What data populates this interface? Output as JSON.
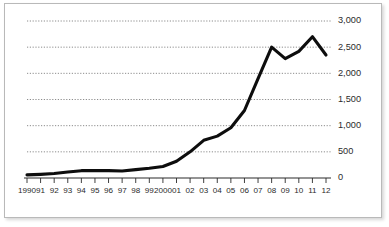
{
  "chart_data": {
    "type": "line",
    "title": "",
    "subtitle": "",
    "xlabel": "",
    "ylabel": "",
    "grid": true,
    "legend": "none",
    "xlim": [
      1990,
      2012
    ],
    "ylim": [
      0,
      3000
    ],
    "y_ticks": [
      0,
      500,
      1000,
      1500,
      2000,
      2500,
      3000
    ],
    "y_tick_labels": [
      "0",
      "500",
      "1,000",
      "1,500",
      "2,000",
      "2,500",
      "3,000"
    ],
    "categories": [
      "1990",
      "91",
      "92",
      "93",
      "94",
      "95",
      "96",
      "97",
      "98",
      "99",
      "2000",
      "01",
      "02",
      "03",
      "04",
      "05",
      "06",
      "07",
      "08",
      "09",
      "10",
      "11",
      "12"
    ],
    "x": [
      1990,
      1991,
      1992,
      1993,
      1994,
      1995,
      1996,
      1997,
      1998,
      1999,
      2000,
      2001,
      2002,
      2003,
      2004,
      2005,
      2006,
      2007,
      2008,
      2009,
      2010,
      2011,
      2012
    ],
    "values": [
      60,
      70,
      85,
      115,
      140,
      140,
      140,
      135,
      160,
      185,
      220,
      320,
      500,
      720,
      800,
      960,
      1290,
      1900,
      2500,
      2280,
      2420,
      2700,
      2350
    ],
    "series": [
      {
        "name": "series-1",
        "values": [
          60,
          70,
          85,
          115,
          140,
          140,
          140,
          135,
          160,
          185,
          220,
          320,
          500,
          720,
          800,
          960,
          1290,
          1900,
          2500,
          2280,
          2420,
          2700,
          2350
        ]
      }
    ],
    "colors": {
      "line": "#0d0d0d",
      "grid": "#6e6e6e",
      "axis": "#2a2a2a",
      "frame": "#b9b9b9",
      "background": "#ffffff",
      "text": "#2b2b2b"
    }
  }
}
